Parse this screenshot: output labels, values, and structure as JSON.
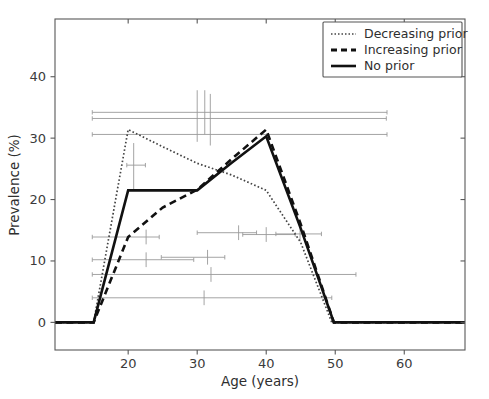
{
  "chart_data": {
    "type": "line",
    "title": "",
    "xlabel": "Age (years)",
    "ylabel": "Prevalence (%)",
    "xlim": [
      9.4,
      68.8
    ],
    "ylim": [
      -4.5,
      49.4
    ],
    "xticks": [
      20,
      30,
      40,
      50,
      60
    ],
    "xtick_labels": [
      "20",
      "30",
      "40",
      "50",
      "60"
    ],
    "yticks": [
      0,
      10,
      20,
      30,
      40
    ],
    "ytick_labels": [
      "0",
      "10",
      "20",
      "30",
      "40"
    ],
    "grid": false,
    "legend_position": "upper right",
    "series": [
      {
        "name": "Decreasing prior",
        "style": "dotted",
        "color": "#444444",
        "x": [
          9.4,
          15,
          20,
          25,
          30,
          35,
          40,
          45,
          49.5,
          50,
          68.8
        ],
        "y": [
          0,
          0,
          31.4,
          28.6,
          25.9,
          24.0,
          21.5,
          13.0,
          0,
          0,
          0
        ]
      },
      {
        "name": "Increasing prior",
        "style": "dashed",
        "color": "#111111",
        "x": [
          9.4,
          15,
          20,
          25,
          30,
          35,
          40,
          45,
          49.8,
          50,
          68.8
        ],
        "y": [
          0,
          0,
          13.9,
          18.7,
          21.6,
          26.6,
          31.4,
          16.0,
          0,
          0,
          0
        ]
      },
      {
        "name": "No prior",
        "style": "solid",
        "color": "#111111",
        "x": [
          9.4,
          15,
          20,
          25,
          30,
          35,
          40,
          45,
          49.8,
          50,
          68.8
        ],
        "y": [
          0,
          0,
          21.5,
          21.5,
          21.5,
          26.0,
          30.3,
          15.3,
          0,
          0,
          0
        ]
      }
    ],
    "error_bars": [
      {
        "y": 34.2,
        "x_lo": 14.8,
        "x_hi": 57.5,
        "x_center": 31.1,
        "y_lo": 37.8,
        "y_hi": 30.6
      },
      {
        "y": 33.2,
        "x_lo": 14.8,
        "x_hi": 57.4,
        "x_center": 31.9,
        "y_lo": 37.2,
        "y_hi": 28.8
      },
      {
        "y": 30.6,
        "x_lo": 14.8,
        "x_hi": 57.5,
        "x_center": 30.0,
        "y_lo": 37.8,
        "y_hi": 29.4
      },
      {
        "y": 25.6,
        "x_lo": 19.8,
        "x_hi": 22.5,
        "x_center": 20.8,
        "y_lo": 29.2,
        "y_hi": 21.5
      },
      {
        "y": 14.4,
        "x_lo": 41.4,
        "x_hi": 48.0,
        "x_center": 44.9,
        "y_lo": 15.6,
        "y_hi": 13.2
      },
      {
        "y": 14.3,
        "x_lo": 36.6,
        "x_hi": 44.2,
        "x_center": 40.0,
        "y_lo": 15.5,
        "y_hi": 13.1
      },
      {
        "y": 14.6,
        "x_lo": 30.0,
        "x_hi": 38.6,
        "x_center": 36.0,
        "y_lo": 15.8,
        "y_hi": 13.4
      },
      {
        "y": 13.9,
        "x_lo": 14.8,
        "x_hi": 24.5,
        "x_center": 22.6,
        "y_lo": 15.1,
        "y_hi": 12.7
      },
      {
        "y": 10.6,
        "x_lo": 24.8,
        "x_hi": 34.0,
        "x_center": 31.5,
        "y_lo": 11.8,
        "y_hi": 9.4
      },
      {
        "y": 10.2,
        "x_lo": 14.8,
        "x_hi": 29.5,
        "x_center": 22.6,
        "y_lo": 11.4,
        "y_hi": 9.0
      },
      {
        "y": 7.8,
        "x_lo": 14.8,
        "x_hi": 53.0,
        "x_center": 32.0,
        "y_lo": 9.0,
        "y_hi": 6.6
      },
      {
        "y": 4.0,
        "x_lo": 14.8,
        "x_hi": 49.5,
        "x_center": 31.0,
        "y_lo": 5.2,
        "y_hi": 2.8
      }
    ],
    "legend_entries": [
      {
        "label": "Decreasing prior",
        "style": "dotted"
      },
      {
        "label": "Increasing prior",
        "style": "dashed"
      },
      {
        "label": "No prior",
        "style": "solid"
      }
    ]
  }
}
